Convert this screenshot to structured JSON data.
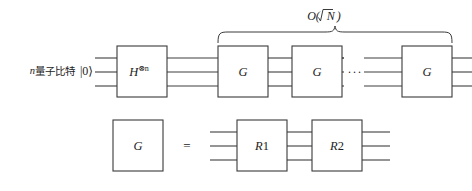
{
  "figure": {
    "kind": "quantum-circuit-diagram",
    "background_color": "#ffffff",
    "line_color": "#3a3a3a",
    "text_color": "#1c1c1c"
  },
  "top_row": {
    "input_label": {
      "prefix_n": "n",
      "chinese": "量子比特",
      "ket": "|0⟩",
      "full": "n量子比特 |0⟩"
    },
    "gates": [
      {
        "id": "hadamard",
        "label": "H",
        "superscript": "⊗n",
        "display": "H⊗n"
      },
      {
        "id": "grover-1",
        "label": "G",
        "superscript": "",
        "display": "G"
      },
      {
        "id": "grover-2",
        "label": "G",
        "superscript": "",
        "display": "G"
      },
      {
        "id": "grover-last",
        "label": "G",
        "superscript": "",
        "display": "G"
      }
    ],
    "ellipsis": "···",
    "brace_label": {
      "text": "O(√N)",
      "function": "O",
      "argument": "√N"
    },
    "wire_count": 3
  },
  "bottom_row": {
    "left_gate": {
      "id": "grover-def",
      "label": "G"
    },
    "equals": "=",
    "right_gates": [
      {
        "id": "r1",
        "label": "R",
        "number": "1",
        "display": "R1"
      },
      {
        "id": "r2",
        "label": "R",
        "number": "2",
        "display": "R2"
      }
    ],
    "wire_count": 3
  }
}
